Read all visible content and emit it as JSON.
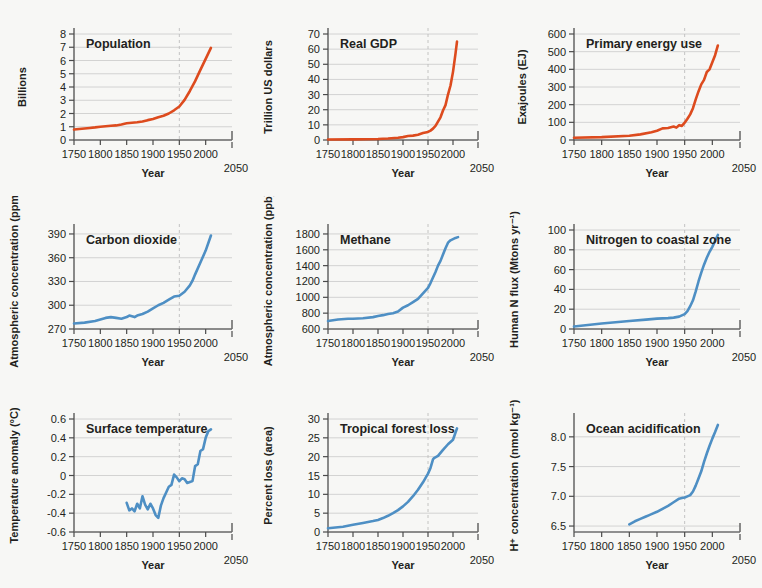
{
  "figure": {
    "background": "#f7f7f5",
    "xlabel": "Year",
    "x_ticks": [
      "1750",
      "1800",
      "1850",
      "1900",
      "1950",
      "2000"
    ],
    "x_end_label": "2050",
    "xlim": [
      1750,
      2050
    ],
    "marker_year": 1950,
    "colors": {
      "socioeconomic": "#DD4B1E",
      "earth_system": "#4E8FC4",
      "grid": "#c9c9c9",
      "axis": "#6d6d6d",
      "dash": "#bdbdbd"
    }
  },
  "chart_data": [
    {
      "id": "population",
      "type": "line",
      "title": "Population",
      "color_key": "socioeconomic",
      "xlabel": "Year",
      "ylabel": "Billions",
      "xlim": [
        1750,
        2050
      ],
      "ylim": [
        0,
        8
      ],
      "y_ticks": [
        "0",
        "1",
        "2",
        "3",
        "4",
        "5",
        "6",
        "7",
        "8"
      ],
      "x_ticks": [
        "1750",
        "1800",
        "1850",
        "1900",
        "1950",
        "2000"
      ],
      "grid": true,
      "x": [
        1750,
        1760,
        1770,
        1780,
        1790,
        1800,
        1810,
        1820,
        1830,
        1840,
        1850,
        1860,
        1870,
        1880,
        1890,
        1900,
        1910,
        1920,
        1930,
        1940,
        1950,
        1960,
        1970,
        1980,
        1990,
        2000,
        2010
      ],
      "y": [
        0.79,
        0.83,
        0.87,
        0.91,
        0.95,
        1.0,
        1.04,
        1.07,
        1.1,
        1.17,
        1.26,
        1.3,
        1.34,
        1.39,
        1.5,
        1.58,
        1.72,
        1.83,
        2.0,
        2.24,
        2.53,
        3.03,
        3.7,
        4.44,
        5.29,
        6.12,
        6.95
      ]
    },
    {
      "id": "real-gdp",
      "type": "line",
      "title": "Real GDP",
      "color_key": "socioeconomic",
      "xlabel": "Year",
      "ylabel": "Trillion US dollars",
      "xlim": [
        1750,
        2050
      ],
      "ylim": [
        0,
        70
      ],
      "y_ticks": [
        "0",
        "10",
        "20",
        "30",
        "40",
        "50",
        "60",
        "70"
      ],
      "x_ticks": [
        "1750",
        "1800",
        "1850",
        "1900",
        "1950",
        "2000"
      ],
      "grid": true,
      "x": [
        1750,
        1800,
        1850,
        1870,
        1890,
        1900,
        1910,
        1920,
        1930,
        1940,
        1950,
        1955,
        1960,
        1965,
        1970,
        1975,
        1980,
        1985,
        1990,
        1995,
        2000,
        2005,
        2008
      ],
      "y": [
        0.3,
        0.4,
        0.7,
        1.0,
        1.5,
        1.9,
        2.6,
        2.9,
        3.5,
        4.6,
        5.3,
        6.2,
        7.5,
        9.3,
        12.2,
        15.0,
        19.5,
        23.0,
        30.0,
        36.0,
        45.0,
        57.0,
        65.0
      ]
    },
    {
      "id": "primary-energy-use",
      "type": "line",
      "title": "Primary energy use",
      "color_key": "socioeconomic",
      "xlabel": "Year",
      "ylabel": "Exajoules (EJ)",
      "xlim": [
        1750,
        2050
      ],
      "ylim": [
        0,
        600
      ],
      "y_ticks": [
        "0",
        "100",
        "200",
        "300",
        "400",
        "500",
        "600"
      ],
      "x_ticks": [
        "1750",
        "1800",
        "1850",
        "1900",
        "1950",
        "2000"
      ],
      "grid": true,
      "x": [
        1750,
        1800,
        1850,
        1870,
        1890,
        1900,
        1910,
        1920,
        1930,
        1935,
        1940,
        1945,
        1950,
        1955,
        1960,
        1965,
        1970,
        1975,
        1980,
        1985,
        1990,
        1995,
        2000,
        2005,
        2010
      ],
      "y": [
        13,
        16,
        24,
        32,
        44,
        52,
        66,
        68,
        76,
        70,
        84,
        80,
        98,
        120,
        145,
        180,
        230,
        275,
        315,
        340,
        385,
        400,
        440,
        480,
        535
      ]
    },
    {
      "id": "carbon-dioxide",
      "type": "line",
      "title": "Carbon dioxide",
      "color_key": "earth_system",
      "xlabel": "Year",
      "ylabel": "Atmospheric concentration (ppm)",
      "xlim": [
        1750,
        2050
      ],
      "ylim": [
        270,
        395
      ],
      "y_ticks": [
        "270",
        "300",
        "330",
        "360",
        "390"
      ],
      "x_ticks": [
        "1750",
        "1800",
        "1850",
        "1900",
        "1950",
        "2000"
      ],
      "grid": true,
      "x": [
        1750,
        1770,
        1790,
        1800,
        1810,
        1820,
        1830,
        1840,
        1850,
        1855,
        1860,
        1865,
        1870,
        1880,
        1890,
        1900,
        1910,
        1920,
        1930,
        1940,
        1950,
        1960,
        1970,
        1975,
        1980,
        1990,
        2000,
        2010
      ],
      "y": [
        277,
        278,
        280,
        282,
        284,
        285,
        284,
        283,
        285,
        287,
        286,
        285,
        287,
        289,
        292,
        296,
        300,
        303,
        307,
        311,
        312,
        317,
        325,
        331,
        339,
        354,
        369,
        388
      ]
    },
    {
      "id": "methane",
      "type": "line",
      "title": "Methane",
      "color_key": "earth_system",
      "xlabel": "Year",
      "ylabel": "Atmospheric concentration (ppb)",
      "xlim": [
        1750,
        2050
      ],
      "ylim": [
        600,
        1850
      ],
      "y_ticks": [
        "600",
        "800",
        "1000",
        "1200",
        "1400",
        "1600",
        "1800"
      ],
      "x_ticks": [
        "1750",
        "1800",
        "1850",
        "1900",
        "1950",
        "2000"
      ],
      "grid": true,
      "x": [
        1750,
        1770,
        1790,
        1800,
        1820,
        1840,
        1850,
        1860,
        1870,
        1880,
        1890,
        1900,
        1910,
        1920,
        1930,
        1940,
        1950,
        1955,
        1960,
        1965,
        1970,
        1975,
        1980,
        1985,
        1990,
        1995,
        2000,
        2005,
        2010
      ],
      "y": [
        700,
        720,
        730,
        730,
        735,
        750,
        765,
        775,
        790,
        800,
        820,
        870,
        900,
        940,
        980,
        1050,
        1120,
        1180,
        1250,
        1320,
        1400,
        1460,
        1540,
        1620,
        1690,
        1720,
        1735,
        1750,
        1760
      ]
    },
    {
      "id": "nitrogen-to-coastal-zone",
      "type": "line",
      "title": "Nitrogen to coastal zone",
      "color_key": "earth_system",
      "xlabel": "Year",
      "ylabel": "Human N flux (Mtons yr⁻¹)",
      "xlim": [
        1750,
        2050
      ],
      "ylim": [
        0,
        100
      ],
      "y_ticks": [
        "0",
        "20",
        "40",
        "60",
        "80",
        "100"
      ],
      "x_ticks": [
        "1750",
        "1800",
        "1850",
        "1900",
        "1950",
        "2000"
      ],
      "grid": true,
      "x": [
        1750,
        1800,
        1850,
        1880,
        1900,
        1920,
        1930,
        1940,
        1950,
        1955,
        1960,
        1965,
        1970,
        1975,
        1980,
        1985,
        1990,
        1995,
        2000,
        2005,
        2010
      ],
      "y": [
        2.5,
        5.5,
        8.0,
        9.5,
        10.5,
        11.0,
        11.5,
        12.5,
        15.0,
        18.0,
        23.0,
        29.0,
        38.0,
        48.0,
        57.0,
        65.0,
        72.0,
        78.0,
        83.0,
        89.0,
        95.0
      ]
    },
    {
      "id": "surface-temperature",
      "type": "line",
      "title": "Surface temperature",
      "color_key": "earth_system",
      "xlabel": "Year",
      "ylabel": "Temperature anomaly (°C)",
      "xlim": [
        1750,
        2050
      ],
      "ylim": [
        -0.6,
        0.6
      ],
      "y_ticks": [
        "-0.6",
        "-0.4",
        "-0.2",
        "0",
        "0.2",
        "0.4",
        "0.6"
      ],
      "x_ticks": [
        "1750",
        "1800",
        "1850",
        "1900",
        "1950",
        "2000"
      ],
      "grid": true,
      "x": [
        1850,
        1855,
        1860,
        1865,
        1870,
        1875,
        1880,
        1885,
        1890,
        1895,
        1900,
        1905,
        1910,
        1915,
        1920,
        1925,
        1930,
        1935,
        1940,
        1945,
        1950,
        1955,
        1960,
        1965,
        1970,
        1975,
        1980,
        1985,
        1990,
        1995,
        2000,
        2005,
        2010
      ],
      "y": [
        -0.29,
        -0.37,
        -0.35,
        -0.38,
        -0.3,
        -0.35,
        -0.22,
        -0.31,
        -0.36,
        -0.3,
        -0.35,
        -0.42,
        -0.45,
        -0.32,
        -0.24,
        -0.18,
        -0.12,
        -0.1,
        0.01,
        -0.02,
        -0.06,
        -0.03,
        -0.04,
        -0.08,
        -0.07,
        -0.06,
        0.1,
        0.12,
        0.26,
        0.28,
        0.4,
        0.47,
        0.49
      ]
    },
    {
      "id": "tropical-forest-loss",
      "type": "line",
      "title": "Tropical forest loss",
      "color_key": "earth_system",
      "xlabel": "Year",
      "ylabel": "Percent loss (area)",
      "xlim": [
        1750,
        2050
      ],
      "ylim": [
        0,
        30
      ],
      "y_ticks": [
        "0",
        "5",
        "10",
        "15",
        "20",
        "25",
        "30"
      ],
      "x_ticks": [
        "1750",
        "1800",
        "1850",
        "1900",
        "1950",
        "2000"
      ],
      "grid": true,
      "x": [
        1750,
        1780,
        1800,
        1820,
        1840,
        1850,
        1860,
        1870,
        1880,
        1890,
        1900,
        1910,
        1920,
        1930,
        1940,
        1950,
        1955,
        1960,
        1962,
        1970,
        1980,
        1990,
        2000,
        2008
      ],
      "y": [
        1.0,
        1.4,
        1.9,
        2.4,
        2.9,
        3.2,
        3.7,
        4.3,
        5.0,
        5.8,
        6.8,
        8.0,
        9.5,
        11.2,
        13.2,
        15.5,
        17.0,
        19.3,
        19.6,
        20.2,
        21.8,
        23.3,
        24.5,
        27.5
      ]
    },
    {
      "id": "ocean-acidification",
      "type": "line",
      "title": "Ocean acidification",
      "color_key": "earth_system",
      "xlabel": "Year",
      "ylabel": "H⁺ concentration (nmol kg⁻¹)",
      "xlim": [
        1750,
        2050
      ],
      "ylim": [
        6.4,
        8.3
      ],
      "y_ticks": [
        "6.5",
        "7.0",
        "7.5",
        "8.0"
      ],
      "x_ticks": [
        "1750",
        "1800",
        "1850",
        "1900",
        "1950",
        "2000"
      ],
      "grid": true,
      "x": [
        1850,
        1860,
        1870,
        1880,
        1885,
        1890,
        1900,
        1910,
        1920,
        1930,
        1940,
        1945,
        1950,
        1955,
        1960,
        1965,
        1970,
        1975,
        1980,
        1985,
        1990,
        1995,
        2000,
        2005,
        2010
      ],
      "y": [
        6.53,
        6.58,
        6.62,
        6.66,
        6.68,
        6.7,
        6.74,
        6.79,
        6.84,
        6.9,
        6.96,
        6.97,
        6.98,
        7.0,
        7.02,
        7.08,
        7.18,
        7.3,
        7.42,
        7.58,
        7.72,
        7.85,
        7.97,
        8.08,
        8.2
      ]
    }
  ]
}
